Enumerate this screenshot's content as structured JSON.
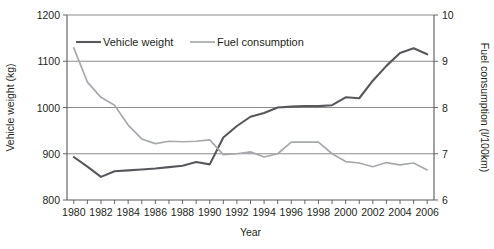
{
  "chart_data": {
    "type": "line",
    "title": "",
    "xlabel": "Year",
    "ylabel": "Vehicle weight (kg)",
    "y2label": "Fuel consumption (l/100km)",
    "grid": true,
    "legend_position": "top-inside",
    "x": [
      1980,
      1981,
      1982,
      1983,
      1984,
      1985,
      1986,
      1987,
      1988,
      1989,
      1990,
      1991,
      1992,
      1993,
      1994,
      1995,
      1996,
      1997,
      1998,
      1999,
      2000,
      2001,
      2002,
      2003,
      2004,
      2005,
      2006
    ],
    "xlim": [
      1979.5,
      2006.5
    ],
    "xticks": [
      1980,
      1981,
      1982,
      1983,
      1984,
      1985,
      1986,
      1987,
      1988,
      1989,
      1990,
      1991,
      1992,
      1993,
      1994,
      1995,
      1996,
      1997,
      1998,
      1999,
      2000,
      2001,
      2002,
      2003,
      2004,
      2005,
      2006
    ],
    "xticklabels": [
      "1980",
      "",
      "1982",
      "",
      "1984",
      "",
      "1986",
      "",
      "1988",
      "",
      "1990",
      "",
      "1992",
      "",
      "1994",
      "",
      "1996",
      "",
      "1998",
      "",
      "2000",
      "",
      "2002",
      "",
      "2004",
      "",
      "2006"
    ],
    "ylim": [
      800,
      1200
    ],
    "yticks": [
      800,
      900,
      1000,
      1100,
      1200
    ],
    "yticklabels": [
      "800",
      "900",
      "1000",
      "1100",
      "1200"
    ],
    "y2lim": [
      6,
      10
    ],
    "y2ticks": [
      6,
      7,
      8,
      9,
      10
    ],
    "y2ticklabels": [
      "6",
      "7",
      "8",
      "9",
      "10"
    ],
    "series": [
      {
        "name": "Vehicle weight",
        "axis": "left",
        "color": "#58585b",
        "units": "kg",
        "values": [
          893,
          872,
          850,
          862,
          864,
          866,
          868,
          871,
          874,
          882,
          877,
          935,
          960,
          980,
          988,
          1000,
          1002,
          1003,
          1003,
          1005,
          1022,
          1020,
          1058,
          1090,
          1118,
          1128,
          1115
        ]
      },
      {
        "name": "Fuel consumption",
        "axis": "right",
        "color": "#a7a9ac",
        "units": "l/100km",
        "values": [
          9.29,
          8.55,
          8.22,
          8.05,
          7.62,
          7.32,
          7.22,
          7.27,
          7.26,
          7.27,
          7.3,
          6.98,
          7.0,
          7.04,
          6.93,
          7.0,
          7.25,
          7.25,
          7.25,
          7.0,
          6.83,
          6.8,
          6.72,
          6.81,
          6.76,
          6.8,
          6.65
        ]
      }
    ]
  },
  "legend": {
    "items": [
      {
        "label": "Vehicle weight",
        "color": "#58585b"
      },
      {
        "label": "Fuel consumption",
        "color": "#a7a9ac"
      }
    ]
  }
}
